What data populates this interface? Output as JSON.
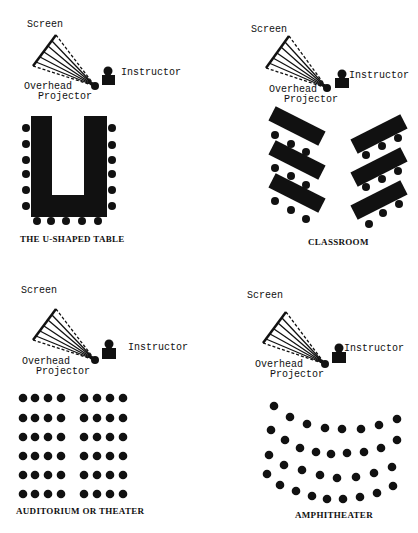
{
  "colors": {
    "ink": "#111111",
    "background": "#ffffff"
  },
  "panels": [
    {
      "id": "u-shaped",
      "caption": "THE U-SHAPED TABLE",
      "screen_label": "Screen",
      "instructor_label": "Instructor",
      "projector_label_1": "Overhead",
      "projector_label_2": "Projector"
    },
    {
      "id": "classroom",
      "caption": "CLASSROOM",
      "screen_label": "Screen",
      "instructor_label": "Instructor",
      "projector_label_1": "Overhead",
      "projector_label_2": "Projector"
    },
    {
      "id": "auditorium",
      "caption": "AUDITORIUM OR THEATER",
      "screen_label": "Screen",
      "instructor_label": "Instructor",
      "projector_label_1": "Overhead",
      "projector_label_2": "Projector"
    },
    {
      "id": "amphitheater",
      "caption": "AMPHITHEATER",
      "screen_label": "Screen",
      "instructor_label": "Instructor",
      "projector_label_1": "Overhead",
      "projector_label_2": "Projector"
    }
  ],
  "seats": {
    "u_shaped": {
      "left_side": 6,
      "right_side": 6,
      "bottom": 5
    },
    "classroom": {
      "tables_left": 3,
      "tables_right": 3,
      "chairs_per_table": 3
    },
    "auditorium": {
      "rows": 6,
      "blocks": 2,
      "seats_per_block_row": 4
    },
    "amphitheater": {
      "rows": 4,
      "seats_per_row": [
        8,
        8,
        8,
        8
      ]
    }
  }
}
